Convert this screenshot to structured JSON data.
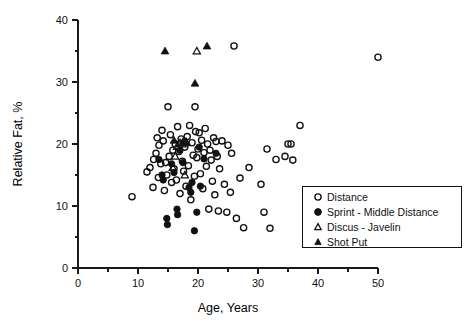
{
  "chart_data": {
    "type": "scatter",
    "title": "",
    "xlabel": "Age, Years",
    "ylabel": "Relative Fat, %",
    "xlim": [
      0,
      50
    ],
    "ylim": [
      0,
      40
    ],
    "xticks": [
      0,
      10,
      20,
      30,
      40,
      50
    ],
    "yticks": [
      0,
      10,
      20,
      30,
      40
    ],
    "xtick_labels": [
      "0",
      "10",
      "20",
      "30",
      "40",
      "50"
    ],
    "ytick_labels": [
      "0",
      "10",
      "20",
      "30",
      "40"
    ],
    "x_minor_step": 5,
    "y_minor_step": 5,
    "grid": false,
    "legend_position": "lower-right",
    "series": [
      {
        "name": "Distance",
        "marker": "open-circle",
        "color": "#111111",
        "points": [
          [
            9.0,
            11.5
          ],
          [
            11.5,
            15.5
          ],
          [
            12.0,
            16.2
          ],
          [
            12.5,
            13.0
          ],
          [
            12.6,
            17.5
          ],
          [
            13.0,
            18.5
          ],
          [
            13.2,
            21.0
          ],
          [
            13.4,
            14.6
          ],
          [
            13.5,
            19.8
          ],
          [
            13.8,
            16.8
          ],
          [
            14.0,
            22.2
          ],
          [
            14.2,
            20.5
          ],
          [
            14.4,
            12.5
          ],
          [
            14.6,
            17.0
          ],
          [
            14.8,
            15.0
          ],
          [
            15.0,
            26.0
          ],
          [
            15.2,
            18.0
          ],
          [
            15.4,
            21.5
          ],
          [
            15.6,
            13.8
          ],
          [
            15.8,
            19.0
          ],
          [
            16.0,
            16.0
          ],
          [
            16.2,
            20.0
          ],
          [
            16.4,
            14.2
          ],
          [
            16.6,
            22.8
          ],
          [
            16.8,
            18.8
          ],
          [
            17.0,
            12.0
          ],
          [
            17.2,
            20.8
          ],
          [
            17.4,
            17.2
          ],
          [
            17.6,
            15.6
          ],
          [
            17.8,
            19.5
          ],
          [
            18.0,
            13.2
          ],
          [
            18.2,
            21.2
          ],
          [
            18.4,
            16.5
          ],
          [
            18.6,
            23.0
          ],
          [
            18.8,
            11.0
          ],
          [
            19.0,
            20.2
          ],
          [
            19.2,
            18.2
          ],
          [
            19.4,
            14.8
          ],
          [
            19.5,
            26.0
          ],
          [
            19.6,
            22.0
          ],
          [
            19.8,
            17.8
          ],
          [
            20.0,
            19.2
          ],
          [
            20.2,
            21.8
          ],
          [
            20.4,
            15.2
          ],
          [
            20.6,
            20.6
          ],
          [
            20.8,
            12.8
          ],
          [
            21.0,
            18.6
          ],
          [
            21.2,
            22.5
          ],
          [
            21.4,
            16.4
          ],
          [
            21.6,
            20.0
          ],
          [
            21.8,
            9.5
          ],
          [
            22.0,
            19.0
          ],
          [
            22.2,
            17.4
          ],
          [
            22.4,
            14.0
          ],
          [
            22.6,
            21.0
          ],
          [
            22.8,
            11.8
          ],
          [
            23.0,
            20.4
          ],
          [
            23.2,
            18.0
          ],
          [
            23.4,
            9.2
          ],
          [
            23.6,
            16.0
          ],
          [
            24.0,
            20.5
          ],
          [
            24.4,
            13.5
          ],
          [
            24.8,
            9.0
          ],
          [
            25.0,
            19.8
          ],
          [
            25.4,
            12.2
          ],
          [
            25.6,
            18.5
          ],
          [
            26.0,
            35.8
          ],
          [
            26.4,
            8.0
          ],
          [
            27.0,
            14.5
          ],
          [
            27.6,
            6.5
          ],
          [
            28.5,
            16.2
          ],
          [
            30.5,
            13.5
          ],
          [
            31.0,
            9.0
          ],
          [
            31.5,
            19.2
          ],
          [
            32.0,
            6.4
          ],
          [
            33.0,
            17.5
          ],
          [
            34.5,
            18.0
          ],
          [
            35.0,
            20.0
          ],
          [
            35.5,
            20.0
          ],
          [
            35.8,
            17.4
          ],
          [
            37.0,
            23.0
          ],
          [
            38.5,
            6.4
          ],
          [
            50.0,
            34.0
          ]
        ]
      },
      {
        "name": "Sprint - Middle Distance",
        "marker": "filled-circle",
        "color": "#111111",
        "points": [
          [
            13.5,
            17.5
          ],
          [
            14.0,
            15.0
          ],
          [
            14.2,
            14.2
          ],
          [
            14.8,
            8.0
          ],
          [
            14.9,
            7.0
          ],
          [
            15.6,
            16.8
          ],
          [
            16.0,
            15.4
          ],
          [
            16.5,
            9.5
          ],
          [
            16.6,
            8.6
          ],
          [
            17.0,
            19.0
          ],
          [
            17.5,
            17.0
          ],
          [
            18.5,
            13.0
          ],
          [
            18.8,
            12.2
          ],
          [
            19.0,
            13.8
          ],
          [
            19.4,
            6.0
          ],
          [
            19.8,
            9.0
          ],
          [
            20.2,
            19.5
          ],
          [
            20.4,
            13.2
          ],
          [
            21.0,
            17.6
          ],
          [
            23.0,
            18.5
          ]
        ]
      },
      {
        "name": "Discus - Javelin",
        "marker": "open-triangle",
        "color": "#111111",
        "points": [
          [
            15.8,
            16.2
          ],
          [
            16.2,
            18.0
          ],
          [
            16.5,
            19.6
          ],
          [
            17.0,
            20.2
          ],
          [
            17.4,
            20.0
          ],
          [
            17.8,
            15.0
          ],
          [
            18.0,
            20.4
          ],
          [
            19.8,
            35.0
          ]
        ]
      },
      {
        "name": "Shot Put",
        "marker": "filled-triangle",
        "color": "#111111",
        "points": [
          [
            16.0,
            20.6
          ],
          [
            17.5,
            20.4
          ],
          [
            18.0,
            20.2
          ],
          [
            14.5,
            35.0
          ],
          [
            19.5,
            29.8
          ],
          [
            21.5,
            35.8
          ]
        ]
      }
    ]
  },
  "legend": {
    "items": [
      {
        "label": "Distance",
        "marker": "open-circle"
      },
      {
        "label": "Sprint - Middle Distance",
        "marker": "filled-circle"
      },
      {
        "label": "Discus - Javelin",
        "marker": "open-triangle"
      },
      {
        "label": "Shot Put",
        "marker": "filled-triangle"
      }
    ]
  }
}
